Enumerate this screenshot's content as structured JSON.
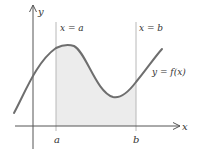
{
  "diagram": {
    "axes": {
      "x_label": "x",
      "y_label": "y"
    },
    "labels": {
      "line_a": "x = a",
      "line_b": "x = b",
      "curve": "y = f(x)",
      "tick_a": "a",
      "tick_b": "b"
    },
    "colors": {
      "curve": "#6e6e6e",
      "axes": "#555555",
      "guide_lines": "#b8b8b8",
      "shaded_region": "#ececec",
      "text": "#333333"
    }
  }
}
